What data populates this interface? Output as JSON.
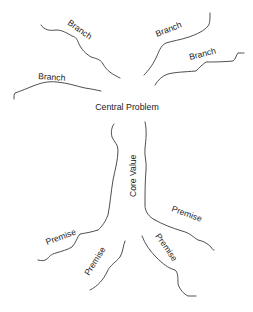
{
  "diagram": {
    "type": "problem-tree",
    "center": {
      "label": "Central Problem"
    },
    "trunk": {
      "label": "Core Value"
    },
    "branches": [
      {
        "label": "Branch",
        "position": "upper-left"
      },
      {
        "label": "Branch",
        "position": "left"
      },
      {
        "label": "Branch",
        "position": "upper-right"
      },
      {
        "label": "Branch",
        "position": "right"
      }
    ],
    "roots": [
      {
        "label": "Premise",
        "position": "lower-left"
      },
      {
        "label": "Premise",
        "position": "lower-left-inner"
      },
      {
        "label": "Premise",
        "position": "lower-right-inner"
      },
      {
        "label": "Premise",
        "position": "lower-right"
      }
    ],
    "colors": {
      "stroke": "#3a3a3a",
      "text": "#222222",
      "background": "#ffffff"
    }
  }
}
